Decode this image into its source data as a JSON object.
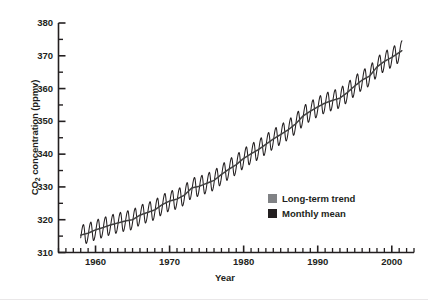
{
  "chart_data": {
    "type": "line",
    "title": "",
    "subtitle": "",
    "xlabel": "Year",
    "ylabel": "CO2 concentration (ppmv)",
    "ylabel_parts": {
      "pre": "CO",
      "sub": "2",
      "post": " concentration (ppmv)"
    },
    "xlim": [
      1955,
      2003
    ],
    "ylim": [
      310,
      380
    ],
    "x_major_ticks": [
      1960,
      1970,
      1980,
      1990,
      2000
    ],
    "x_tick_labels": [
      "1960",
      "1970",
      "1980",
      "1990",
      "2000"
    ],
    "x_minor_tick_interval": 1,
    "y_major_ticks": [
      310,
      320,
      330,
      340,
      350,
      360,
      370,
      380
    ],
    "y_tick_labels": [
      "310",
      "320",
      "330",
      "340",
      "350",
      "360",
      "370",
      "380"
    ],
    "y_minor_ticks": [
      315,
      325,
      335,
      345,
      355,
      365,
      375
    ],
    "grid": false,
    "legend_position": "inside-lower-right",
    "series": [
      {
        "name": "Long-term trend",
        "color": "#808285",
        "type": "line",
        "description": "Smooth rising annual-mean trend through the monthly data",
        "x": [
          1958,
          1959,
          1960,
          1961,
          1962,
          1963,
          1964,
          1965,
          1966,
          1967,
          1968,
          1969,
          1970,
          1971,
          1972,
          1973,
          1974,
          1975,
          1976,
          1977,
          1978,
          1979,
          1980,
          1981,
          1982,
          1983,
          1984,
          1985,
          1986,
          1987,
          1988,
          1989,
          1990,
          1991,
          1992,
          1993,
          1994,
          1995,
          1996,
          1997,
          1998,
          1999,
          2000,
          2001
        ],
        "values": [
          315.3,
          315.9,
          316.9,
          317.6,
          318.4,
          319.0,
          319.6,
          320.0,
          321.4,
          322.2,
          323.0,
          324.6,
          325.7,
          326.3,
          327.5,
          329.7,
          330.2,
          331.1,
          332.0,
          333.8,
          335.4,
          336.8,
          338.7,
          340.1,
          341.4,
          343.0,
          344.6,
          346.0,
          347.4,
          349.2,
          351.6,
          353.1,
          354.4,
          355.6,
          356.4,
          357.1,
          358.8,
          360.8,
          362.6,
          363.8,
          366.6,
          368.3,
          369.5,
          371.0
        ]
      },
      {
        "name": "Monthly mean",
        "color": "#231f20",
        "type": "line",
        "description": "Monthly mean CO2 with seasonal sawtooth oscillation of roughly +/- 3 ppmv, peaking in May and troughing in late September",
        "seasonal_amplitude_ppmv": 3.0,
        "seasonal_peak_month": 5,
        "seasonal_trough_month": 9
      }
    ]
  },
  "legend": {
    "items": [
      {
        "label": "Long-term trend",
        "color": "#808285"
      },
      {
        "label": "Monthly mean",
        "color": "#231f20"
      }
    ]
  },
  "axes": {
    "x_title": "Year",
    "y_title_pre": "CO",
    "y_title_sub": "2",
    "y_title_post": " concentration (ppmv)"
  }
}
